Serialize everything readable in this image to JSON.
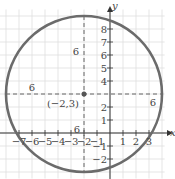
{
  "chart_data": {
    "type": "scatter",
    "title": "",
    "xlabel": "x",
    "ylabel": "y",
    "xlim": [
      -7.5,
      3.8
    ],
    "ylim": [
      -2.9,
      8.9
    ],
    "grid": true,
    "x_ticks": [
      "-7",
      "-6",
      "-5",
      "-4",
      "-3",
      "-2",
      "-1",
      "1",
      "2",
      "3"
    ],
    "y_ticks": [
      "8",
      "7",
      "6",
      "5",
      "4",
      "2",
      "1",
      "-1",
      "-2"
    ],
    "circle": {
      "center": [
        -2,
        3
      ],
      "radius": 6,
      "equation": "(x+2)^2 + (y-3)^2 = 36"
    },
    "center_label": "(−2,3)",
    "radius_labels": [
      "6",
      "6",
      "6",
      "6"
    ],
    "colors": {
      "circle": "#6b6b6b",
      "grid": "#dcdcdc",
      "axis": "#333333",
      "dash": "#555555"
    }
  }
}
